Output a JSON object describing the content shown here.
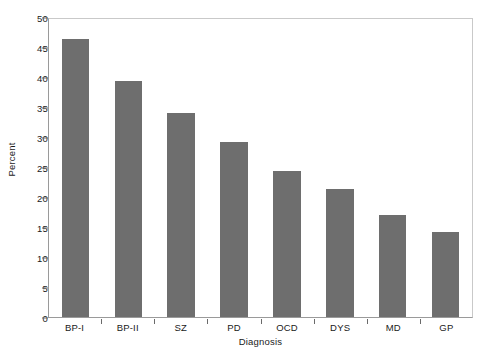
{
  "chart_data": {
    "type": "bar",
    "title": "",
    "subtitle": "",
    "xlabel": "Diagnosis",
    "ylabel": "Percent",
    "categories": [
      "BP-I",
      "BP-II",
      "SZ",
      "PD",
      "OCD",
      "DYS",
      "MD",
      "GP"
    ],
    "values": [
      46.3,
      39.4,
      34.0,
      29.1,
      24.3,
      21.4,
      17.0,
      14.2
    ],
    "ylim": [
      0,
      50
    ],
    "ytick_labels": [
      "0",
      "5",
      "10",
      "15",
      "20",
      "25",
      "30",
      "35",
      "40",
      "45",
      "50"
    ],
    "ytick_values": [
      0,
      5,
      10,
      15,
      20,
      25,
      30,
      35,
      40,
      45,
      50
    ],
    "grid": false,
    "legend": "none",
    "bar_color": "#6e6e6e",
    "frame_color": "#c9c9c9",
    "axis_color": "#9a9a9a",
    "text_color": "#1a1a1a",
    "background": "#ffffff"
  }
}
